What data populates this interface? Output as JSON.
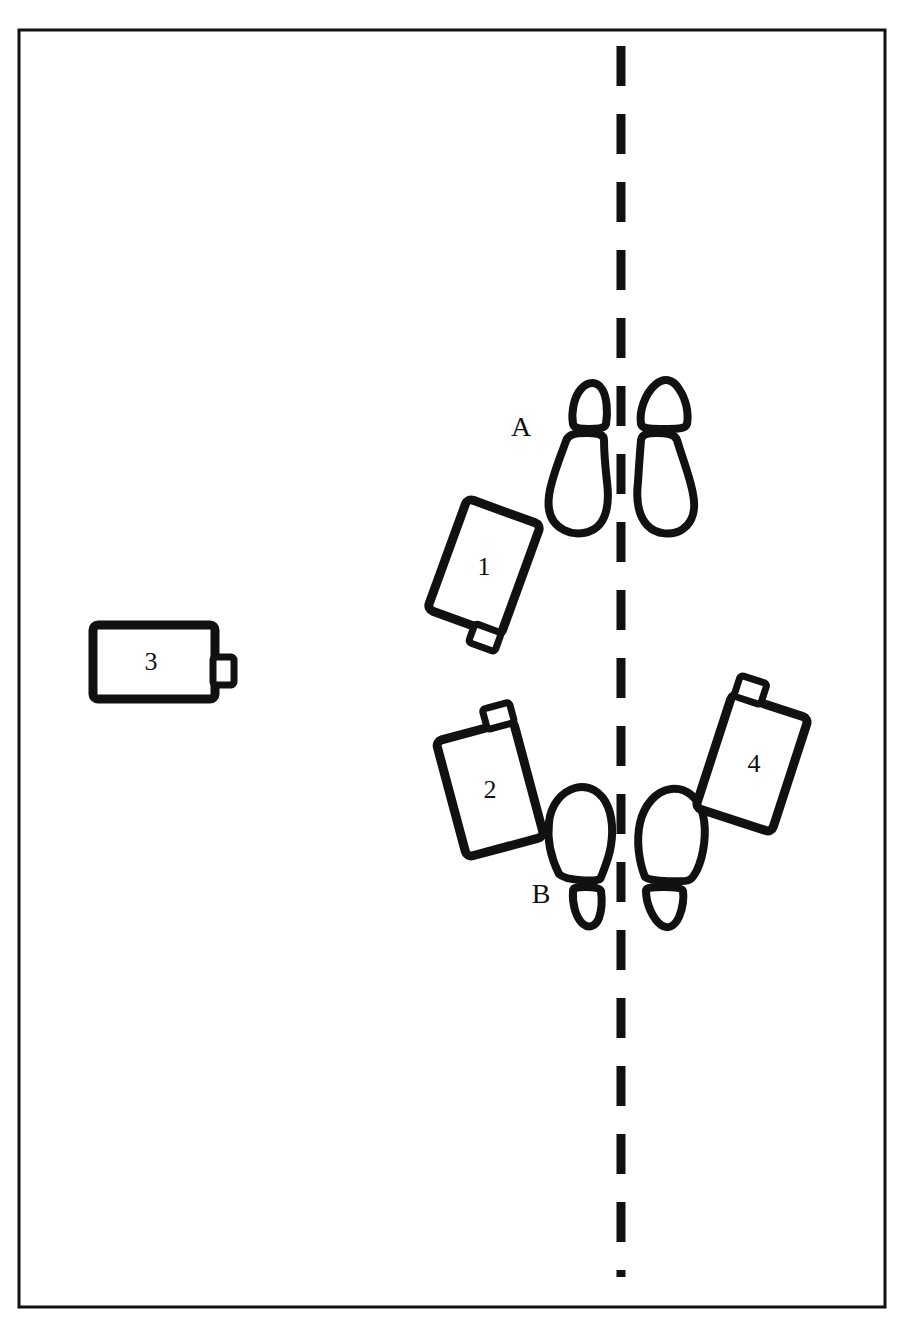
{
  "figure": {
    "type": "hand-drawn-scene-sketch",
    "background_color": "#ffffff",
    "ink_color": "#111111",
    "border": {
      "present": true,
      "x": 19,
      "y": 30,
      "width": 866,
      "height": 1277,
      "stroke_width": 3
    }
  },
  "center_line": {
    "name": "dashed-center-line",
    "orientation": "vertical",
    "x": 621,
    "y_start": 46,
    "y_end": 1277,
    "dash_length": 40,
    "gap_length": 28,
    "stroke_width": 9
  },
  "footprint_groups": [
    {
      "id": "A",
      "label": "A",
      "label_x": 521,
      "label_y": 436,
      "direction": "pointing-down",
      "left_foot": {
        "cx": 585,
        "cy": 458
      },
      "right_foot": {
        "cx": 660,
        "cy": 455
      }
    },
    {
      "id": "B",
      "label": "B",
      "label_x": 541,
      "label_y": 903,
      "direction": "pointing-up",
      "left_foot": {
        "cx": 583,
        "cy": 840
      },
      "right_foot": {
        "cx": 662,
        "cy": 838
      }
    }
  ],
  "objects": [
    {
      "id": "1",
      "label": "1",
      "shape": "rounded-rectangle-with-tab",
      "cx": 484,
      "cy": 567,
      "width": 78,
      "height": 118,
      "rotation_deg": 20,
      "tab": "bottom-right"
    },
    {
      "id": "2",
      "label": "2",
      "shape": "rounded-rectangle-with-tab",
      "cx": 490,
      "cy": 789,
      "width": 80,
      "height": 120,
      "rotation_deg": -15,
      "tab": "top-right"
    },
    {
      "id": "3",
      "label": "3",
      "shape": "rounded-rectangle-with-tab",
      "cx": 154,
      "cy": 662,
      "width": 122,
      "height": 74,
      "rotation_deg": 0,
      "tab": "right-middle"
    },
    {
      "id": "4",
      "label": "4",
      "shape": "rounded-rectangle-with-tab",
      "cx": 752,
      "cy": 763,
      "width": 80,
      "height": 120,
      "rotation_deg": 18,
      "tab": "top-left"
    }
  ]
}
